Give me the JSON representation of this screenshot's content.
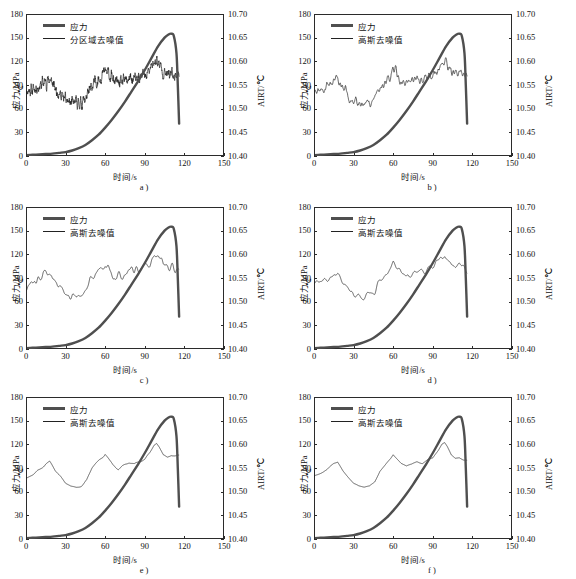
{
  "figure": {
    "type": "multi-panel-line-chart",
    "panel_count": 6,
    "layout": "2 columns x 3 rows",
    "caption_fragment": ""
  },
  "axes_common": {
    "xlabel": "时间/s",
    "ylabel_left": "应力/MPa",
    "ylabel_left_secondary": "℃",
    "ylabel_right": "AIRT/℃",
    "xticks": [
      "0",
      "30",
      "60",
      "90",
      "120",
      "150"
    ],
    "yticks_left": [
      "0",
      "30",
      "60",
      "90",
      "120",
      "150",
      "180"
    ],
    "yticks_right": [
      "10.40",
      "10.45",
      "10.50",
      "10.55",
      "10.60",
      "10.65",
      "10.70"
    ],
    "xlim": [
      0,
      150
    ],
    "ylim_left": [
      0,
      180
    ],
    "ylim_right": [
      10.4,
      10.7
    ],
    "grid": false,
    "legend_position": "upper left"
  },
  "colors": {
    "stress_line": "#4f4f4f",
    "noise_line": "#222222",
    "axis": "#2b2b2b",
    "text": "#111111"
  },
  "legend_labels": {
    "stress": "应力",
    "regional_denoise": "分区域去噪值",
    "gaussian_denoise": "高斯去噪值"
  },
  "panels": [
    {
      "id": "a",
      "sublabel": "a )",
      "legend": [
        "应力",
        "分区域去噪值"
      ],
      "noise_smoothing": 1,
      "noise_amplitude": 13.5,
      "seed": 11
    },
    {
      "id": "b",
      "sublabel": "b )",
      "legend": [
        "应力",
        "高斯去噪值"
      ],
      "noise_smoothing": 2,
      "noise_amplitude": 10.5,
      "seed": 23
    },
    {
      "id": "c",
      "sublabel": "c )",
      "legend": [
        "应力",
        "高斯去噪值"
      ],
      "noise_smoothing": 3,
      "noise_amplitude": 8.5,
      "seed": 37
    },
    {
      "id": "d",
      "sublabel": "d )",
      "legend": [
        "应力",
        "高斯去噪值"
      ],
      "noise_smoothing": 4,
      "noise_amplitude": 7.0,
      "seed": 41
    },
    {
      "id": "e",
      "sublabel": "e )",
      "legend": [
        "应力",
        "高斯去噪值"
      ],
      "noise_smoothing": 6,
      "noise_amplitude": 5.0,
      "seed": 53
    },
    {
      "id": "f",
      "sublabel": "f )",
      "legend": [
        "应力",
        "高斯去噪值"
      ],
      "noise_smoothing": 9,
      "noise_amplitude": 3.2,
      "seed": 67
    }
  ],
  "chart_data": {
    "type": "line",
    "title": "",
    "xlabel": "时间/s",
    "ylabel": "应力/MPa",
    "ylabel_right": "AIRT/℃",
    "xlim": [
      0,
      150
    ],
    "ylim": [
      0,
      180
    ],
    "ylim_right": [
      10.4,
      10.7
    ],
    "grid": false,
    "legend": [
      "应力",
      "分区域去噪值 / 高斯去噪值"
    ],
    "series": [
      {
        "name": "应力",
        "axis": "left",
        "unit": "MPa",
        "x": [
          0,
          5,
          10,
          15,
          20,
          25,
          30,
          35,
          40,
          45,
          50,
          55,
          60,
          65,
          70,
          75,
          80,
          85,
          90,
          95,
          100,
          105,
          108,
          110,
          112,
          114,
          115,
          116
        ],
        "values": [
          1,
          1.5,
          2,
          2.5,
          3,
          4,
          5,
          7,
          10,
          14,
          20,
          27,
          36,
          46,
          57,
          69,
          82,
          95,
          109,
          124,
          139,
          150,
          154,
          155,
          152,
          130,
          90,
          41
        ]
      },
      {
        "name": "AIRT 去噪值 (denoised baseline, panel a-f share this trend)",
        "axis": "right",
        "unit": "℃",
        "x": [
          0,
          5,
          10,
          15,
          18,
          22,
          26,
          30,
          34,
          38,
          42,
          46,
          50,
          54,
          58,
          60,
          63,
          66,
          70,
          74,
          78,
          82,
          86,
          90,
          94,
          97,
          99,
          101,
          104,
          107,
          110,
          113,
          116
        ],
        "values_as_left_scale_mpa": [
          82,
          85,
          88,
          95,
          97,
          86,
          78,
          70,
          67,
          66,
          68,
          74,
          88,
          95,
          103,
          108,
          102,
          96,
          92,
          94,
          98,
          96,
          100,
          101,
          110,
          119,
          121,
          116,
          106,
          103,
          105,
          103,
          103
        ],
        "values_airt_celsius": [
          10.537,
          10.542,
          10.547,
          10.558,
          10.562,
          10.543,
          10.53,
          10.517,
          10.512,
          10.51,
          10.513,
          10.523,
          10.547,
          10.558,
          10.572,
          10.58,
          10.57,
          10.56,
          10.553,
          10.557,
          10.563,
          10.56,
          10.567,
          10.568,
          10.583,
          10.598,
          10.602,
          10.593,
          10.577,
          10.572,
          10.575,
          10.572,
          10.572
        ]
      }
    ]
  },
  "watermark_text": ""
}
